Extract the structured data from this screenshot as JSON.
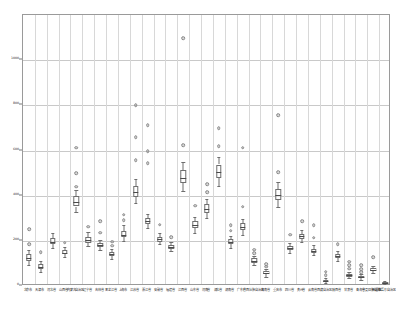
{
  "chart_data": {
    "type": "box",
    "title": "",
    "xlabel": "",
    "ylabel": "",
    "ylim": [
      0,
      1200
    ],
    "yticks": [
      0,
      200,
      400,
      600,
      800,
      1000
    ],
    "ytick_labels": [
      "0",
      "200",
      "400",
      "600",
      "800",
      "1000"
    ],
    "grid": true,
    "legend": null,
    "categories": [
      "北京市",
      "天津市",
      "河北省",
      "山西省",
      "内蒙古自治区",
      "辽宁省",
      "吉林省",
      "黑龙江省",
      "上海市",
      "江苏省",
      "浙江省",
      "安徽省",
      "福建省",
      "江西省",
      "山东省",
      "河南省",
      "湖北省",
      "湖南省",
      "广东省",
      "广西壮族自治区",
      "海南省",
      "重庆市",
      "四川省",
      "贵州省",
      "云南省",
      "西藏自治区",
      "陕西省",
      "甘肃省",
      "青海省",
      "宁夏回族自治区",
      "新疆维吾尔自治区"
    ],
    "boxes": [
      {
        "cat": "北京市",
        "min": 95,
        "q1": 112,
        "median": 126,
        "q3": 140,
        "max": 160,
        "outliers": [
          252,
          186
        ]
      },
      {
        "cat": "天津市",
        "min": 62,
        "q1": 76,
        "median": 86,
        "q3": 96,
        "max": 112,
        "outliers": [
          150
        ]
      },
      {
        "cat": "河北省",
        "min": 168,
        "q1": 186,
        "median": 196,
        "q3": 214,
        "max": 236,
        "outliers": []
      },
      {
        "cat": "山西省",
        "min": 128,
        "q1": 140,
        "median": 148,
        "q3": 158,
        "max": 172,
        "outliers": [
          192
        ]
      },
      {
        "cat": "内蒙古自治区",
        "min": 326,
        "q1": 352,
        "median": 372,
        "q3": 398,
        "max": 424,
        "outliers": [
          612,
          500,
          440
        ]
      },
      {
        "cat": "辽宁省",
        "min": 178,
        "q1": 192,
        "median": 204,
        "q3": 218,
        "max": 238,
        "outliers": [
          262
        ]
      },
      {
        "cat": "吉林省",
        "min": 160,
        "q1": 172,
        "median": 180,
        "q3": 190,
        "max": 204,
        "outliers": [
          286,
          236
        ]
      },
      {
        "cat": "黑龙江省",
        "min": 120,
        "q1": 132,
        "median": 140,
        "q3": 150,
        "max": 164,
        "outliers": [
          196,
          178
        ]
      },
      {
        "cat": "上海市",
        "min": 198,
        "q1": 216,
        "median": 228,
        "q3": 244,
        "max": 268,
        "outliers": [
          316,
          292
        ]
      },
      {
        "cat": "江苏省",
        "min": 368,
        "q1": 396,
        "median": 418,
        "q3": 444,
        "max": 472,
        "outliers": [
          800,
          660,
          556
        ]
      },
      {
        "cat": "浙江省",
        "min": 258,
        "q1": 276,
        "median": 288,
        "q3": 302,
        "max": 320,
        "outliers": [
          712,
          596,
          544
        ]
      },
      {
        "cat": "安徽省",
        "min": 184,
        "q1": 196,
        "median": 206,
        "q3": 218,
        "max": 234,
        "outliers": [
          272
        ]
      },
      {
        "cat": "福建省",
        "min": 156,
        "q1": 166,
        "median": 174,
        "q3": 182,
        "max": 194,
        "outliers": [
          216
        ]
      },
      {
        "cat": "江西省",
        "min": 420,
        "q1": 456,
        "median": 480,
        "q3": 512,
        "max": 548,
        "outliers": [
          1096,
          624
        ]
      },
      {
        "cat": "山东省",
        "min": 236,
        "q1": 256,
        "median": 270,
        "q3": 286,
        "max": 306,
        "outliers": [
          356
        ]
      },
      {
        "cat": "河南省",
        "min": 302,
        "q1": 324,
        "median": 342,
        "q3": 362,
        "max": 386,
        "outliers": [
          452,
          416
        ]
      },
      {
        "cat": "湖北省",
        "min": 444,
        "q1": 480,
        "median": 506,
        "q3": 538,
        "max": 572,
        "outliers": [
          700,
          620
        ]
      },
      {
        "cat": "湖南省",
        "min": 170,
        "q1": 184,
        "median": 194,
        "q3": 206,
        "max": 222,
        "outliers": [
          268,
          244
        ]
      },
      {
        "cat": "广东省",
        "min": 228,
        "q1": 248,
        "median": 262,
        "q3": 278,
        "max": 298,
        "outliers": [
          612,
          352
        ]
      },
      {
        "cat": "广西壮族自治区",
        "min": 92,
        "q1": 104,
        "median": 112,
        "q3": 122,
        "max": 134,
        "outliers": [
          160,
          146
        ]
      },
      {
        "cat": "海南省",
        "min": 42,
        "q1": 52,
        "median": 58,
        "q3": 66,
        "max": 76,
        "outliers": [
          96,
          86
        ]
      },
      {
        "cat": "重庆市",
        "min": 350,
        "q1": 380,
        "median": 402,
        "q3": 430,
        "max": 460,
        "outliers": [
          756,
          504
        ]
      },
      {
        "cat": "四川省",
        "min": 148,
        "q1": 160,
        "median": 168,
        "q3": 178,
        "max": 192,
        "outliers": [
          228
        ]
      },
      {
        "cat": "贵州省",
        "min": 196,
        "q1": 210,
        "median": 220,
        "q3": 232,
        "max": 248,
        "outliers": [
          288
        ]
      },
      {
        "cat": "云南省",
        "min": 136,
        "q1": 148,
        "median": 156,
        "q3": 166,
        "max": 180,
        "outliers": [
          268,
          214
        ]
      },
      {
        "cat": "西藏自治区",
        "min": 14,
        "q1": 20,
        "median": 24,
        "q3": 28,
        "max": 36,
        "outliers": [
          64,
          48
        ]
      },
      {
        "cat": "陕西省",
        "min": 112,
        "q1": 124,
        "median": 132,
        "q3": 142,
        "max": 156,
        "outliers": [
          184
        ]
      },
      {
        "cat": "甘肃省",
        "min": 34,
        "q1": 42,
        "median": 48,
        "q3": 54,
        "max": 64,
        "outliers": [
          108,
          92,
          76
        ]
      },
      {
        "cat": "青海省",
        "min": 26,
        "q1": 34,
        "median": 38,
        "q3": 44,
        "max": 52,
        "outliers": [
          92,
          74,
          62
        ]
      },
      {
        "cat": "宁夏回族自治区",
        "min": 56,
        "q1": 66,
        "median": 72,
        "q3": 80,
        "max": 90,
        "outliers": [
          128
        ]
      },
      {
        "cat": "新疆维吾尔自治区",
        "min": 8,
        "q1": 12,
        "median": 15,
        "q3": 19,
        "max": 24,
        "outliers": []
      }
    ]
  },
  "style": {
    "box_line_color": "#6e6e6e",
    "median_color": "#4a4a4a",
    "grid_color": "#d8d8d8",
    "frame_color": "#9a9a9a",
    "background": "#ffffff"
  }
}
